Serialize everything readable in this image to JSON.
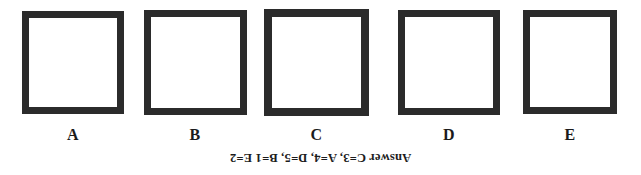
{
  "page": {
    "background_color": "#ffffff",
    "ink_color": "#2b2b2b"
  },
  "boxes": [
    {
      "label": "A"
    },
    {
      "label": "B"
    },
    {
      "label": "C"
    },
    {
      "label": "D"
    },
    {
      "label": "E"
    }
  ],
  "answer_key": {
    "text": "Answer C=3, A=4, D=5, B=1 E=2",
    "orientation": "upside-down"
  }
}
